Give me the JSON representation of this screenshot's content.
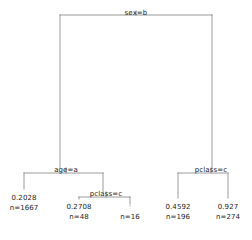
{
  "figure": {
    "type": "decision-tree",
    "line_color": "#808080",
    "text_color": "#1a1a1a",
    "background": "#ffffff"
  },
  "tree": {
    "internal_nodes": [
      {
        "id": "root",
        "label": "sex=b",
        "x": 136,
        "y": 9
      },
      {
        "id": "left-split",
        "label": "age=a",
        "x": 66,
        "y": 166
      },
      {
        "id": "mid-split",
        "label": "pclass=c",
        "x": 106,
        "y": 190
      },
      {
        "id": "right-split",
        "label": "pclass=c",
        "x": 211,
        "y": 166
      }
    ],
    "leaves": [
      {
        "id": "leaf-1",
        "value": "0.2028",
        "count": "n=1667",
        "x": 24,
        "y": 194,
        "faint": false
      },
      {
        "id": "leaf-2",
        "value": "0.2708",
        "count": "n=48",
        "x": 79,
        "y": 203,
        "faint": false
      },
      {
        "id": "leaf-3",
        "value": "1",
        "count": "n=16",
        "x": 130,
        "y": 203,
        "faint": true
      },
      {
        "id": "leaf-4",
        "value": "0.4592",
        "count": "n=196",
        "x": 178,
        "y": 203,
        "faint": false
      },
      {
        "id": "leaf-5",
        "value": "0.927",
        "count": "n=274",
        "x": 228,
        "y": 203,
        "faint": false
      }
    ],
    "edges": [
      {
        "id": "root-bar",
        "type": "horizontal",
        "x1": 60,
        "x2": 212,
        "y": 15
      },
      {
        "id": "root-stem",
        "type": "vertical",
        "x": 136,
        "y1": 11,
        "y2": 15
      },
      {
        "id": "root-to-left",
        "type": "vertical",
        "x": 60,
        "y1": 15,
        "y2": 168
      },
      {
        "id": "root-to-right",
        "type": "vertical",
        "x": 212,
        "y1": 15,
        "y2": 168
      },
      {
        "id": "left-bar",
        "type": "horizontal",
        "x1": 24,
        "x2": 103,
        "y": 173
      },
      {
        "id": "left-stem",
        "type": "vertical",
        "x": 66,
        "y1": 168,
        "y2": 173
      },
      {
        "id": "left-to-leaf1",
        "type": "vertical",
        "x": 24,
        "y1": 173,
        "y2": 189
      },
      {
        "id": "left-to-mid",
        "type": "vertical",
        "x": 103,
        "y1": 173,
        "y2": 192
      },
      {
        "id": "mid-bar",
        "type": "horizontal",
        "x1": 79,
        "x2": 130,
        "y": 197
      },
      {
        "id": "mid-stem",
        "type": "vertical",
        "x": 106,
        "y1": 192,
        "y2": 197
      },
      {
        "id": "mid-to-leaf2",
        "type": "vertical",
        "x": 79,
        "y1": 197,
        "y2": 199
      },
      {
        "id": "mid-to-leaf3",
        "type": "vertical",
        "x": 130,
        "y1": 197,
        "y2": 206
      },
      {
        "id": "right-bar",
        "type": "horizontal",
        "x1": 178,
        "x2": 228,
        "y": 173
      },
      {
        "id": "right-stem",
        "type": "vertical",
        "x": 211,
        "y1": 168,
        "y2": 173
      },
      {
        "id": "right-to-leaf4",
        "type": "vertical",
        "x": 178,
        "y1": 173,
        "y2": 198
      },
      {
        "id": "right-to-leaf5",
        "type": "vertical",
        "x": 228,
        "y1": 173,
        "y2": 198
      }
    ]
  }
}
